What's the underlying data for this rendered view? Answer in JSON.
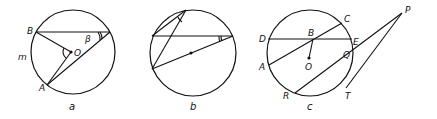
{
  "figures": [
    {
      "id": "a",
      "caption": "a",
      "labels": {
        "B": "B",
        "O": "O",
        "A": "A",
        "m": "m",
        "beta": "β"
      }
    },
    {
      "id": "b",
      "caption": "b",
      "labels": {}
    },
    {
      "id": "c",
      "caption": "c",
      "labels": {
        "D": "D",
        "B": "B",
        "C": "C",
        "E": "E",
        "O": "O",
        "A": "A",
        "Q": "Q",
        "R": "R",
        "T": "T",
        "P": "P"
      }
    }
  ],
  "colors": {
    "stroke": "#111111",
    "background": "#ffffff"
  }
}
